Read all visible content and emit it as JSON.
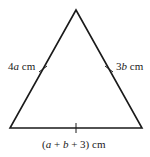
{
  "diagram": {
    "shape": "isosceles-triangle",
    "vertices": {
      "apex": [
        76,
        10
      ],
      "bottom_left": [
        10,
        128
      ],
      "bottom_right": [
        142,
        128
      ]
    },
    "stroke_color": "#1a1a1a",
    "labels": {
      "left_side": {
        "coef": "4",
        "var": "a",
        "unit": "cm"
      },
      "right_side": {
        "coef": "3",
        "var": "b",
        "unit": "cm"
      },
      "base": {
        "open": "(",
        "a": "a",
        "plus1": " + ",
        "b": "b",
        "plus2": " + 3)",
        "unit": "cm"
      }
    },
    "tick_marks": [
      "left-side-midpoint",
      "right-side-midpoint",
      "base-midpoint"
    ]
  }
}
